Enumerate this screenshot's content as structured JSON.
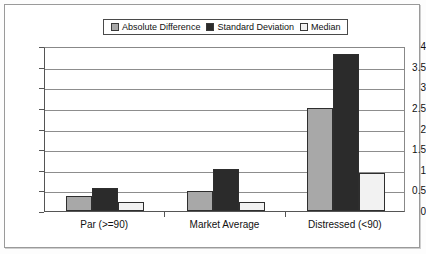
{
  "chart_data": {
    "type": "bar",
    "title": "",
    "xlabel": "",
    "ylabel": "",
    "ylim": [
      0,
      4
    ],
    "ytick_step": 0.5,
    "yticks": [
      "4",
      "3.5",
      "3",
      "2.5",
      "2",
      "1.5",
      "1",
      "0.5",
      "0"
    ],
    "grid": true,
    "legend_position": "top-center",
    "categories": [
      "Par (>=90)",
      "Market Average",
      "Distressed (<90)"
    ],
    "series": [
      {
        "name": "Absolute Difference",
        "color": "#a8a8a8",
        "values": [
          0.36,
          0.48,
          2.5
        ]
      },
      {
        "name": "Standard Deviation",
        "color": "#2b2b2b",
        "values": [
          0.55,
          1.02,
          3.8
        ]
      },
      {
        "name": "Median",
        "color": "#f2f2f2",
        "values": [
          0.22,
          0.23,
          0.93
        ]
      }
    ]
  },
  "colors": {
    "axis": "#555555",
    "gridline": "#8d8d8d",
    "frame": "#9a9a9a",
    "text": "#111111",
    "background": "#ffffff"
  }
}
